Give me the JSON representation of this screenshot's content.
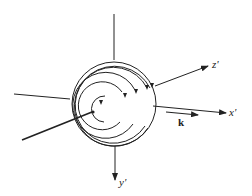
{
  "figure": {
    "axes": {
      "x": {
        "label": "x'"
      },
      "y": {
        "label": "y'"
      },
      "z": {
        "label": "z'"
      }
    },
    "vector": {
      "label": "k"
    },
    "colors": {
      "line": "#222222",
      "background": "#ffffff"
    }
  }
}
